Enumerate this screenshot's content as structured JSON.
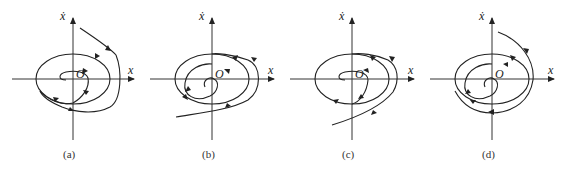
{
  "figure": {
    "axis_labels": {
      "x": "x",
      "y": "ẋ",
      "origin": "O"
    },
    "panels": [
      {
        "id": "a",
        "caption": "(a)",
        "behavior": "stable limit cycle: outer trajectory spirals inward, inner spirals outward"
      },
      {
        "id": "b",
        "caption": "(b)",
        "behavior": "unstable limit cycle: trajectories diverge from cycle"
      },
      {
        "id": "c",
        "caption": "(c)",
        "behavior": "semi-stable: outside approaches, inside leaves"
      },
      {
        "id": "d",
        "caption": "(d)",
        "behavior": "semi-stable: outside approaches from above, inside spirals"
      }
    ]
  }
}
